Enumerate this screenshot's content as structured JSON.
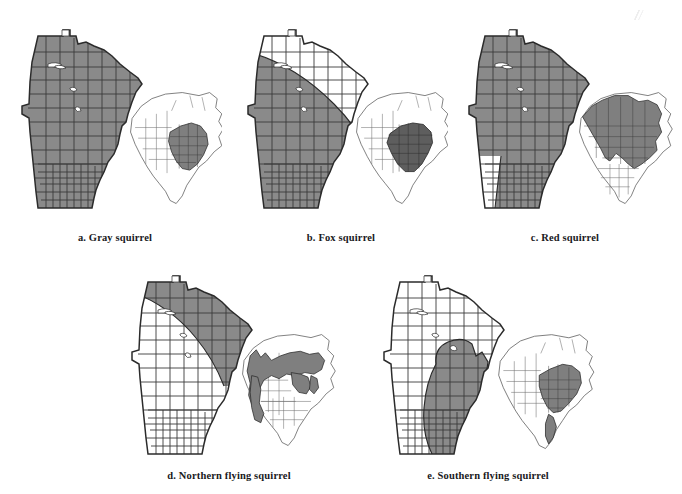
{
  "figure": {
    "type": "distribution-map-plate",
    "background_color": "#ffffff",
    "shade_color": "#8a8a8a",
    "shade_color_inset": "#7f7f7f",
    "outline_color": "#2b2b2b",
    "inset_outline_color": "#4a4a4a",
    "state_depicted": "Minnesota",
    "inset_region": "North America"
  },
  "panels": [
    {
      "key": "a",
      "caption": "a. Gray squirrel",
      "species": "Gray squirrel",
      "letter": "a",
      "mn_range_description": "Nearly statewide shading; entire state shaded except small white lake areas and the Northwest Angle tip",
      "mn_shaded_fraction": 0.97,
      "inset_range_description": "Eastern United States, shaded from the Great Plains east to the Atlantic and north to the Great Lakes"
    },
    {
      "key": "b",
      "caption": "b. Fox squirrel",
      "species": "Fox squirrel",
      "letter": "b",
      "mn_range_description": "Southwestern two thirds shaded; a diagonal boundary runs from the northwest corner southeast to the east central border, leaving the northeast arrowhead white",
      "mn_shaded_fraction": 0.66,
      "inset_range_description": "Central and eastern United States, shaded darker than the other panels, extending into eastern Texas"
    },
    {
      "key": "c",
      "caption": "c. Red squirrel",
      "species": "Red squirrel",
      "letter": "c",
      "mn_range_description": "Almost the entire state shaded; only a small block of counties in the far southwest corner remains white",
      "mn_shaded_fraction": 0.93,
      "inset_range_description": "Broad boreal band across Canada plus the Rocky Mountains, Great Lakes and Appalachian regions"
    },
    {
      "key": "d",
      "caption": "d. Northern flying squirrel",
      "species": "Northern flying squirrel",
      "letter": "d",
      "mn_range_description": "Northeastern half shaded; a diagonal boundary runs from the northwest corner to the southeast, leaving the southwestern counties white",
      "mn_shaded_fraction": 0.55,
      "inset_range_description": "Boreal Canada, the Pacific Northwest, the northern Rockies, the Great Lakes and the Appalachian spine"
    },
    {
      "key": "e",
      "caption": "e. Southern flying squirrel",
      "species": "Southern flying squirrel",
      "letter": "e",
      "mn_range_description": "A rounded lobed region covering east central and southeastern counties; the rest of the state is white",
      "mn_shaded_fraction": 0.33,
      "inset_range_description": "Eastern United States east of the Great Plains, with a narrow extension down eastern Mexico"
    }
  ]
}
